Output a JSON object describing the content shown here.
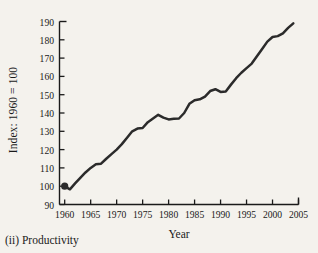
{
  "figure": {
    "caption": "(ii) Productivity",
    "background_color": "#f4f2ed",
    "line_color": "#2b2b2b",
    "axis_color": "#1a1a1a"
  },
  "chart_data": {
    "type": "line",
    "title": "",
    "xlabel": "Year",
    "ylabel": "Index: 1960 = 100",
    "xlim": [
      1959,
      2005
    ],
    "ylim": [
      90,
      190
    ],
    "grid": false,
    "legend": null,
    "xticks": [
      1960,
      1965,
      1970,
      1975,
      1980,
      1985,
      1990,
      1995,
      2000,
      2005
    ],
    "xtick_labels": [
      "1960",
      "1965",
      "1970",
      "1975",
      "1980",
      "1985",
      "1990",
      "1995",
      "2000",
      "2005"
    ],
    "yticks": [
      90,
      100,
      110,
      120,
      130,
      140,
      150,
      160,
      170,
      180,
      190
    ],
    "ytick_labels": [
      "90",
      "100",
      "110",
      "120",
      "130",
      "140",
      "150",
      "160",
      "170",
      "180",
      "190"
    ],
    "markers": [
      {
        "x": 1960,
        "y": 100,
        "label": "1960 = 100"
      }
    ],
    "series": [
      {
        "name": "Productivity index",
        "x": [
          1960,
          1961,
          1962,
          1963,
          1964,
          1965,
          1966,
          1967,
          1968,
          1969,
          1970,
          1971,
          1972,
          1973,
          1974,
          1975,
          1976,
          1977,
          1978,
          1979,
          1980,
          1981,
          1982,
          1983,
          1984,
          1985,
          1986,
          1987,
          1988,
          1989,
          1990,
          1991,
          1992,
          1993,
          1994,
          1995,
          1996,
          1997,
          1998,
          1999,
          2000,
          2001,
          2002,
          2003,
          2004
        ],
        "y": [
          100.0,
          98.3,
          101.5,
          104.5,
          107.5,
          110.0,
          112.0,
          112.3,
          115.0,
          117.5,
          120.0,
          123.0,
          126.5,
          130.0,
          131.5,
          131.8,
          135.0,
          137.0,
          139.0,
          137.5,
          136.5,
          136.8,
          137.0,
          140.0,
          145.0,
          147.0,
          147.5,
          149.0,
          152.0,
          153.0,
          151.5,
          151.8,
          155.5,
          159.0,
          162.0,
          164.5,
          167.0,
          171.0,
          175.0,
          179.0,
          181.5,
          182.0,
          183.5,
          186.5,
          189.0
        ]
      }
    ]
  }
}
